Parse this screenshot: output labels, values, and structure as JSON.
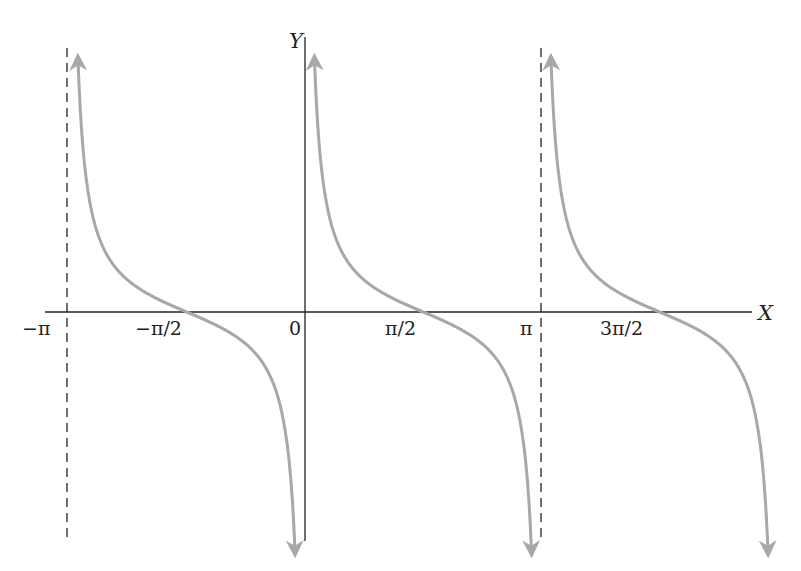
{
  "chart_data": {
    "type": "line",
    "title": "",
    "function": "y = cot(x)",
    "xlabel": "X",
    "ylabel": "Y",
    "x_tick_labels": [
      "−π",
      "−π/2",
      "0",
      "π/2",
      "π",
      "3π/2"
    ],
    "x_tick_values": [
      -3.14159,
      -1.5708,
      0,
      1.5708,
      3.14159,
      4.71239
    ],
    "xlim": [
      -3.3,
      5.8
    ],
    "asymptotes": [
      {
        "x": -3.14159,
        "label": "−π",
        "style": "dashed"
      },
      {
        "x": 0,
        "label": "0",
        "style": "axis"
      },
      {
        "x": 3.14159,
        "label": "π",
        "style": "dashed"
      }
    ],
    "branches": [
      {
        "x_range": [
          -3.0,
          -0.17
        ],
        "zero_crossing": -1.5708
      },
      {
        "x_range": [
          0.02,
          2.97
        ],
        "zero_crossing": 1.5708
      },
      {
        "x_range": [
          3.16,
          6.1
        ],
        "zero_crossing": 4.71239
      }
    ],
    "curve_color": "#a8a8a8",
    "axis_color": "#222222",
    "grid": false,
    "legend": null
  },
  "labels": {
    "x_axis": "X",
    "y_axis": "Y",
    "ticks": {
      "neg_pi": "−π",
      "neg_half_pi": "−π/2",
      "zero": "0",
      "half_pi": "π/2",
      "pi": "π",
      "three_half_pi": "3π/2"
    }
  }
}
